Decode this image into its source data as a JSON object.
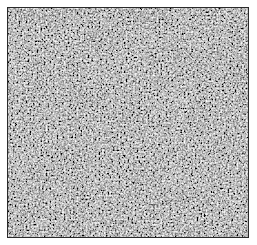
{
  "image": {
    "description": "Grayscale micrograph of densely packed cells with dark nuclei",
    "colors": {
      "background": "#9a9a9a",
      "nucleus_dark": "#3a3a3a",
      "cytoplasm_light": "#c8c8c8",
      "border": "#2a2a2a"
    }
  }
}
